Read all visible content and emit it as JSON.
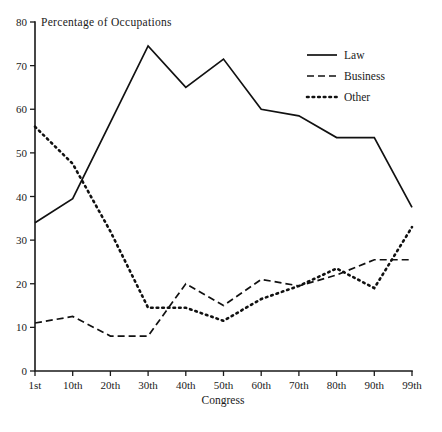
{
  "chart_data": {
    "type": "line",
    "title": "Percentage of Occupations",
    "xlabel": "Congress",
    "ylabel": "",
    "categories": [
      "1st",
      "10th",
      "20th",
      "30th",
      "40th",
      "50th",
      "60th",
      "70th",
      "80th",
      "90th",
      "99th"
    ],
    "ylim": [
      0,
      80
    ],
    "xlim": [
      0,
      10
    ],
    "y_ticks": [
      0,
      10,
      20,
      30,
      40,
      50,
      60,
      70,
      80
    ],
    "grid": false,
    "legend_position": "top-right",
    "series": [
      {
        "name": "Law",
        "style": "solid",
        "values": [
          34,
          39.5,
          57,
          74.5,
          65,
          71.5,
          60,
          58.5,
          53.5,
          53.5,
          37.5
        ]
      },
      {
        "name": "Business",
        "style": "dashed",
        "values": [
          11,
          12.5,
          8,
          8,
          20,
          15,
          21,
          19.5,
          22,
          25.5,
          25.5
        ]
      },
      {
        "name": "Other",
        "style": "dotted",
        "values": [
          56,
          47.5,
          32,
          14.5,
          14.5,
          11.5,
          16.5,
          19.5,
          23.5,
          19,
          33
        ]
      }
    ]
  },
  "legend": {
    "entries": [
      {
        "label": "Law",
        "style": "solid"
      },
      {
        "label": "Business",
        "style": "dashed"
      },
      {
        "label": "Other",
        "style": "dotted"
      }
    ]
  },
  "axes": {
    "y_tick_labels": [
      "80",
      "70",
      "60",
      "50",
      "40",
      "30",
      "20",
      "10",
      "0"
    ],
    "x_tick_labels": [
      "1st",
      "10th",
      "20th",
      "30th",
      "40th",
      "50th",
      "60th",
      "70th",
      "80th",
      "90th",
      "99th"
    ],
    "x_axis_title": "Congress",
    "plot_title": "Percentage of Occupations"
  },
  "colors": {
    "ink": "#1a1a1a",
    "background": "#ffffff"
  }
}
